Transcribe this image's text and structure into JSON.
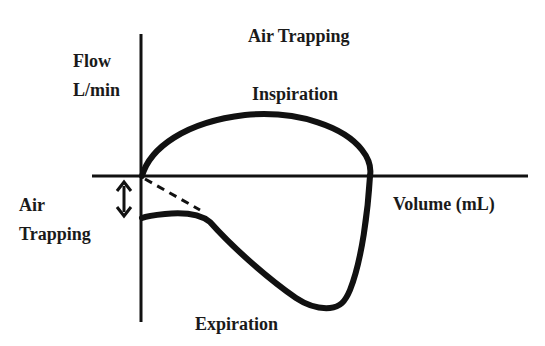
{
  "diagram": {
    "title": "Air Trapping",
    "y_axis_label_line1": "Flow",
    "y_axis_label_line2": "L/min",
    "x_axis_label": "Volume (mL)",
    "upper_curve_label": "Inspiration",
    "lower_curve_label": "Expiration",
    "annotation_line1": "Air",
    "annotation_line2": "Trapping",
    "colors": {
      "background": "#ffffff",
      "stroke": "#111111",
      "text": "#1a1a1a"
    }
  }
}
